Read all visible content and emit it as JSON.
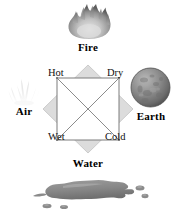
{
  "diagram": {
    "elements": [
      {
        "name": "Fire",
        "icon": "flame-icon",
        "position": "top"
      },
      {
        "name": "Air",
        "icon": "wisp-icon",
        "position": "left"
      },
      {
        "name": "Earth",
        "icon": "sphere-icon",
        "position": "right"
      },
      {
        "name": "Water",
        "icon": "puddle-icon",
        "position": "bottom"
      }
    ],
    "qualities": [
      {
        "name": "Hot",
        "corner": "top-left"
      },
      {
        "name": "Dry",
        "corner": "top-right"
      },
      {
        "name": "Wet",
        "corner": "bottom-left"
      },
      {
        "name": "Cold",
        "corner": "bottom-right"
      }
    ],
    "shapes": {
      "outer": "diamond",
      "inner": "square",
      "inner_fill": "#ffffff",
      "cross": "both-diagonals"
    },
    "colors": {
      "background": "#ffffff",
      "diamond_fill": "#dcdcdc",
      "diamond_stroke": "#c8c8c8",
      "square_stroke": "#808080",
      "diagonal_stroke": "#8c8c8c",
      "text": "#000000",
      "earth_dark": "#5a5a5a",
      "earth_light": "#b4b4b4",
      "water_gray": "#8e8e8e",
      "fire_gray": "#9a9a9a"
    }
  }
}
